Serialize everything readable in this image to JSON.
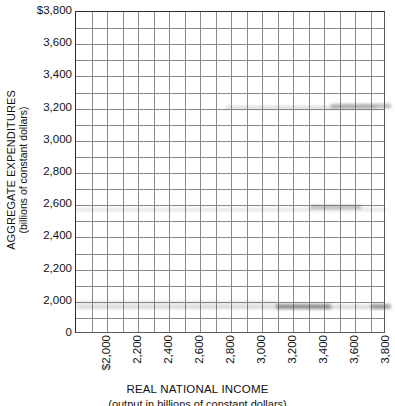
{
  "chart_data": {
    "type": "line",
    "title": "",
    "xlabel": "REAL NATIONAL INCOME",
    "xsublabel": "(output in billions of constant dollars)",
    "ylabel": "AGGREGATE EXPENDITURES",
    "ysublabel": "(billions of constant dollars)",
    "xlim": [
      1900,
      3900
    ],
    "ylim": [
      0,
      3800
    ],
    "grid": true,
    "legend": null,
    "series": [],
    "x_tick_labels": [
      "$2,000",
      "2,200",
      "2,400",
      "2,600",
      "2,800",
      "3,000",
      "3,200",
      "3,400",
      "3,600",
      "3,800"
    ],
    "x_tick_values": [
      2000,
      2200,
      2400,
      2600,
      2800,
      3000,
      3200,
      3400,
      3600,
      3800
    ],
    "y_tick_labels": [
      "$3,800",
      "3,600",
      "3,400",
      "3,200",
      "3,000",
      "2,800",
      "2,600",
      "2,400",
      "2,200",
      "2,000",
      "0"
    ],
    "y_tick_values": [
      3800,
      3600,
      3400,
      3200,
      3000,
      2800,
      2600,
      2400,
      2200,
      2000,
      0
    ],
    "axis_break": true,
    "grid_columns": 20,
    "grid_rows": 20,
    "colors": {
      "gridline": "#8a8a8a",
      "axis": "#2b2b2b",
      "background": "#ffffff",
      "text": "#111111"
    }
  }
}
